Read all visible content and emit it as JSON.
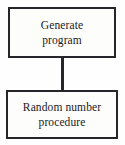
{
  "diagram": {
    "type": "flowchart",
    "orientation": "vertical",
    "background_color": "#fefefe",
    "border_color": "#26262a",
    "text_color": "#1a1a1c",
    "nodes": [
      {
        "id": "generate-program",
        "shape": "rectangle",
        "line1": "Generate",
        "line2": "program"
      },
      {
        "id": "random-number-procedure",
        "shape": "rectangle",
        "line1": "Random number",
        "line2": "procedure"
      }
    ],
    "connectors": [
      {
        "id": "generate-to-random",
        "from": "generate-program",
        "to": "random-number-procedure",
        "style": "straight-line",
        "arrowhead": "none"
      }
    ]
  }
}
